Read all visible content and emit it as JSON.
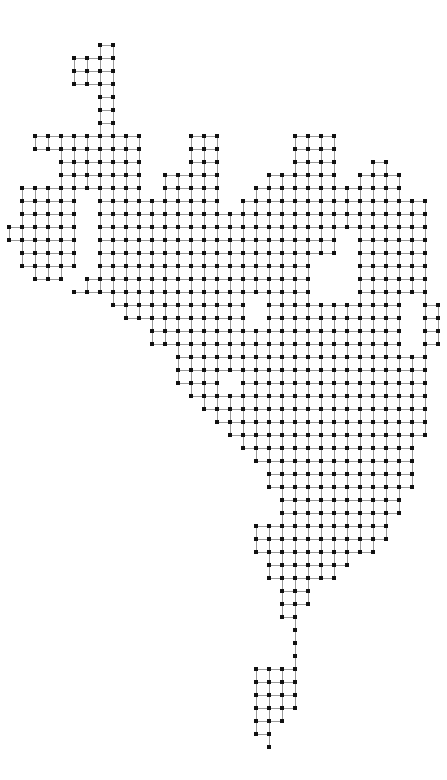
{
  "figure": {
    "name": "lattice-graph-figure",
    "type": "graph",
    "background_color": "#ffffff",
    "node_color": "#111111",
    "edge_color": "#9a9a9a",
    "node_size_px": 4,
    "edge_width_px": 1,
    "grid_spacing_px": 13,
    "origin_x_px": 22,
    "origin_y_px": 45,
    "canvas_width_px": 447,
    "canvas_height_px": 780,
    "columns": 32,
    "rows": 56,
    "grid_rows": [
      "00000000000000000000000000000000",
      "00000001100000000000000000000000",
      "00000111100000000000000000000000",
      "00000111100000000000000000000000",
      "00000111100000000000000000000000",
      "00000011100000000000000000000000",
      "00000001100000000000000000000000",
      "00000001100000000000000000000000",
      "00000001100000001100000000000000",
      "00000001100000001100000000000000",
      "00011111111100001100000000000000",
      "00011111111100001100000000000000",
      "00000111111100001100000000000000",
      "00000111111100001100000000000000",
      "00000111111100001100000000000000",
      "00000111111100001100000000000000",
      "00000111111100001100000000000000",
      "00000111111100001100000000000000",
      "00000111111100001100000000000000",
      "00000111111100001100000000000000",
      "00000111111100001100000000000000",
      "00000111111100001100000000000000",
      "00000111111100001100000000000000",
      "00000111111100001100000000000000",
      "00000111111100001100000000000000",
      "00000111111100001100000000000000",
      "00000111111100001100000000000000",
      "00000111111100001100000000000000",
      "00000111111100001100000000000000",
      "00000111111100001100000000000000",
      "00000111111100001100000000000000",
      "00000111111100001100000000000000",
      "00000111111100001100000000000000",
      "00000111111100001100000000000000",
      "00000111111100001100000000000000",
      "00000111111100001100000000000000",
      "00000111111100001100000000000000",
      "00000111111100001100000000000000",
      "00000111111100001100000000000000",
      "00000111111100001100000000000000",
      "00000111111100001100000000000000",
      "00000111111100001100000000000000",
      "00000111111100001100000000000000",
      "00000111111100001100000000000000",
      "00000111111100001100000000000000",
      "00000111111100001100000000000000",
      "00000111111100001100000000000000",
      "00000111111100001100000000000000",
      "00000111111100001100000000000000",
      "00000111111100001100000000000000",
      "00000111111100001100000000000000",
      "00000111111100001100000000000000",
      "00000111111100001100000000000000",
      "00000111111100001100000000000000",
      "00000111111100001100000000000000",
      "00000000000000000000000000000000"
    ],
    "node_count_label": "",
    "title": "",
    "axis_labels": []
  },
  "lattice_points": [
    [
      7,
      1
    ],
    [
      8,
      1
    ],
    [
      5,
      2
    ],
    [
      6,
      2
    ],
    [
      7,
      2
    ],
    [
      8,
      2
    ],
    [
      5,
      3
    ],
    [
      6,
      3
    ],
    [
      7,
      3
    ],
    [
      8,
      3
    ],
    [
      5,
      4
    ],
    [
      6,
      4
    ],
    [
      7,
      4
    ],
    [
      8,
      4
    ],
    [
      7,
      5
    ],
    [
      8,
      5
    ],
    [
      7,
      6
    ],
    [
      8,
      6
    ],
    [
      7,
      7
    ],
    [
      8,
      7
    ],
    [
      3,
      8
    ],
    [
      4,
      8
    ],
    [
      5,
      8
    ],
    [
      6,
      8
    ],
    [
      7,
      8
    ],
    [
      8,
      8
    ],
    [
      9,
      8
    ],
    [
      10,
      8
    ],
    [
      15,
      8
    ],
    [
      16,
      8
    ],
    [
      17,
      8
    ],
    [
      3,
      9
    ],
    [
      4,
      9
    ],
    [
      5,
      9
    ],
    [
      6,
      9
    ],
    [
      7,
      9
    ],
    [
      8,
      9
    ],
    [
      9,
      9
    ],
    [
      10,
      9
    ],
    [
      15,
      9
    ],
    [
      22,
      5
    ],
    [
      23,
      5
    ],
    [
      24,
      5
    ],
    [
      25,
      5
    ],
    [
      22,
      6
    ],
    [
      23,
      6
    ],
    [
      24,
      6
    ],
    [
      25,
      6
    ],
    [
      22,
      7
    ],
    [
      23,
      7
    ],
    [
      24,
      7
    ],
    [
      25,
      7
    ],
    [
      22,
      8
    ],
    [
      23,
      8
    ],
    [
      24,
      8
    ],
    [
      25,
      8
    ],
    [
      26,
      8
    ],
    [
      27,
      8
    ],
    [
      29,
      8
    ],
    [
      22,
      9
    ],
    [
      23,
      9
    ],
    [
      24,
      9
    ],
    [
      25,
      9
    ],
    [
      26,
      9
    ],
    [
      27,
      9
    ],
    [
      28,
      9
    ],
    [
      29,
      9
    ]
  ],
  "meta": {
    "stroke_style": "solid-thin",
    "node_shape": "square",
    "figure_caption": ""
  }
}
